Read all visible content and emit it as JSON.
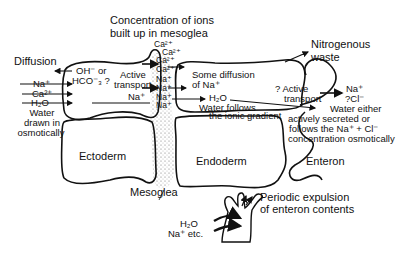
{
  "title": {
    "line1": "Concentration of ions",
    "line2": "built up in mesoglea"
  },
  "left": {
    "diffusion": "Diffusion",
    "ions_in": [
      "Na⁺",
      "Ca²⁺",
      "H₂O"
    ],
    "water_note": [
      "Water",
      "drawn in",
      "osmotically"
    ],
    "oh_hco": [
      "OH⁻ or",
      "HCO⁻₃ ?"
    ],
    "active_transport": [
      "Active",
      "transport"
    ],
    "na_in": "Na⁺"
  },
  "mesoglea_ions": [
    "Ca²⁺",
    "Ca²⁺",
    "Ca²⁺",
    "Ca²⁺",
    "Na⁺",
    "Na⁺",
    "Na⁺",
    "Na⁺"
  ],
  "middle": {
    "some_diffusion": [
      "Some diffusion",
      "of Na⁺"
    ],
    "h2o": "H₂O",
    "water_follows": [
      "Water follows",
      "the ionic gradient"
    ]
  },
  "right": {
    "nitrogenous": [
      "Nitrogenous",
      "waste"
    ],
    "active_transport": [
      "? Active",
      "transport"
    ],
    "ions_out": [
      "Na⁺",
      "?Cl⁻"
    ],
    "water_note": [
      "Water either",
      "actively secreted or",
      "follows the Na⁺ + Cl⁻",
      "concentration osmotically"
    ]
  },
  "layers": {
    "ectoderm": "Ectoderm",
    "endoderm": "Endoderm",
    "enteron": "Enteron",
    "mesoglea": "Mesoglea"
  },
  "inset": {
    "caption": [
      "Periodic expulsion",
      "of enteron contents"
    ],
    "inputs": [
      "H₂O",
      "Na⁺ etc."
    ]
  }
}
